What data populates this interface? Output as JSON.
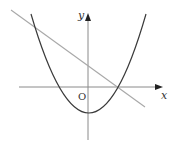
{
  "figure": {
    "type": "coordinate-graph",
    "axes": {
      "x_label": "x",
      "y_label": "y",
      "origin_label": "O",
      "color": "#8a8a8a"
    },
    "curves": [
      {
        "name": "parabola",
        "kind": "upward-opening parabola",
        "vertex_below_origin": true,
        "color": "#3a3a3a"
      },
      {
        "name": "line",
        "kind": "decreasing straight line",
        "color": "#a8a8a8"
      }
    ],
    "intersections": [
      {
        "description": "line meets parabola in upper-left region"
      },
      {
        "description": "line meets parabola at parabola's positive x-intercept"
      }
    ]
  }
}
